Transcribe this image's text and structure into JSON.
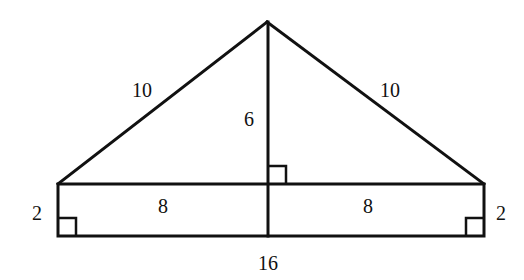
{
  "diagram": {
    "type": "geometry-figure",
    "labels": {
      "left_hypotenuse": "10",
      "right_hypotenuse": "10",
      "altitude": "6",
      "left_half_base": "8",
      "right_half_base": "8",
      "left_height": "2",
      "right_height": "2",
      "bottom_length": "16"
    },
    "points": {
      "apex": [
        267,
        22
      ],
      "rect_top_left": [
        58,
        184
      ],
      "rect_top_right": [
        484,
        184
      ],
      "rect_bottom_left": [
        58,
        236
      ],
      "rect_bottom_right": [
        484,
        236
      ],
      "altitude_top": [
        268,
        22
      ],
      "altitude_bottom": [
        268,
        236
      ]
    },
    "right_angle_markers": [
      {
        "name": "altitude-base",
        "x": 268,
        "y": 166,
        "size": 18
      },
      {
        "name": "bottom-left",
        "x": 58,
        "y": 218,
        "size": 18
      },
      {
        "name": "bottom-right",
        "x": 466,
        "y": 218,
        "size": 18
      }
    ],
    "colors": {
      "stroke": "#111111",
      "background": "#ffffff"
    }
  }
}
